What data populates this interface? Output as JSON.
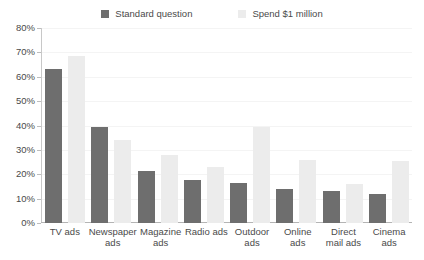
{
  "chart_data": {
    "type": "bar",
    "title": "",
    "xlabel": "",
    "ylabel": "",
    "ylim": [
      0,
      80
    ],
    "ytick_labels": [
      "80%",
      "70%",
      "60%",
      "50%",
      "40%",
      "30%",
      "20%",
      "10%",
      "0%"
    ],
    "ytick_values": [
      80,
      70,
      60,
      50,
      40,
      30,
      20,
      10,
      0
    ],
    "grid": true,
    "legend_position": "top-center",
    "categories": [
      "TV ads",
      "Newspaper ads",
      "Magazine ads",
      "Radio ads",
      "Outdoor ads",
      "Online ads",
      "Direct mail ads",
      "Cinema ads"
    ],
    "series": [
      {
        "name": "Standard question",
        "color": "#6e6e6e",
        "values": [
          63,
          39.5,
          21.5,
          17.5,
          16.5,
          14,
          13,
          12
        ]
      },
      {
        "name": "Spend $1 million",
        "color": "#ececec",
        "values": [
          68.5,
          34,
          28,
          23,
          39.5,
          26,
          16,
          25.5
        ]
      }
    ]
  },
  "axis": {
    "line_color": "#c8c8c8",
    "grid_color": "#f4f4f4",
    "text_color": "#4a4a4a"
  }
}
